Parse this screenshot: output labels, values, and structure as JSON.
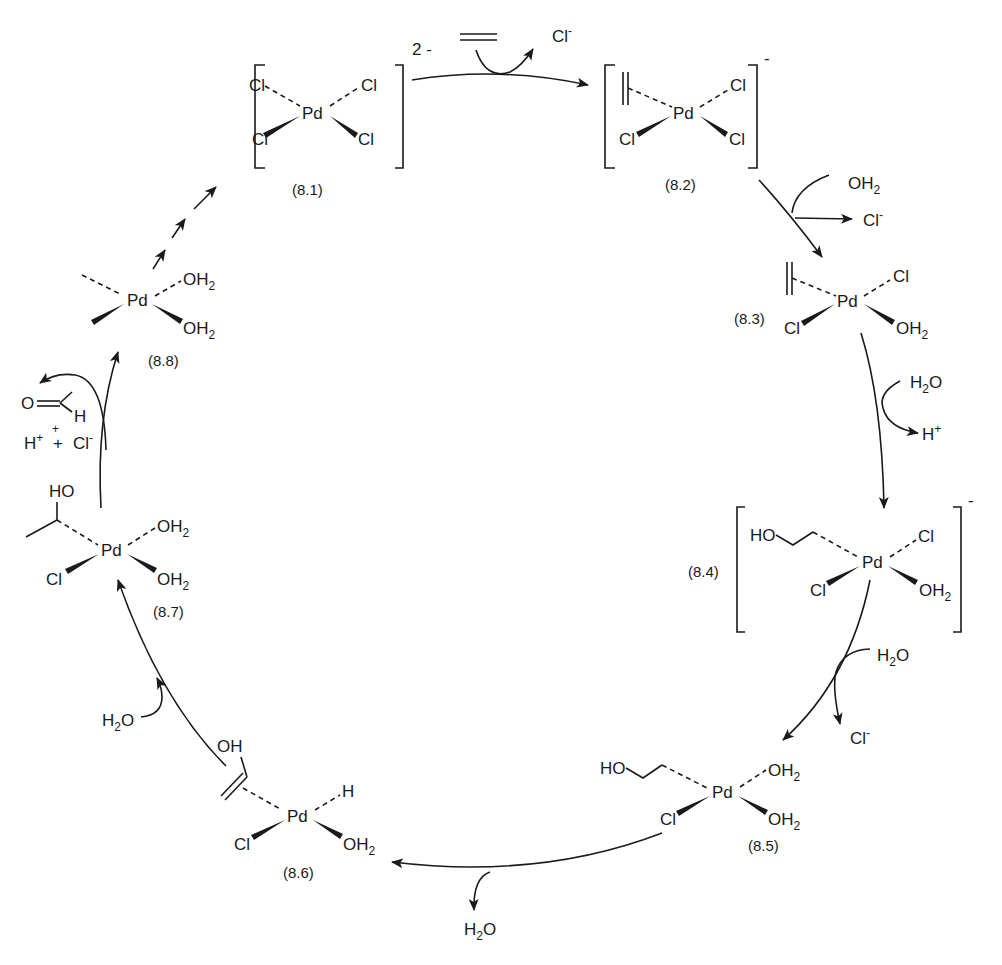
{
  "diagram": {
    "colors": {
      "ink": "#1a1a1a",
      "background": "#ffffff"
    },
    "species": [
      {
        "id": "8.1",
        "label": "(8.1)",
        "charge": "2 -",
        "ligands": {
          "top_left": "Cl",
          "top_right": "Cl",
          "bottom_left": "Cl",
          "bottom_right": "Cl"
        },
        "center": "Pd"
      },
      {
        "id": "8.2",
        "label": "(8.2)",
        "charge": "-",
        "ligands": {
          "top_left": "ethylene",
          "top_right": "Cl",
          "bottom_left": "Cl",
          "bottom_right": "Cl"
        },
        "center": "Pd"
      },
      {
        "id": "8.3",
        "label": "(8.3)",
        "ligands": {
          "top_left": "ethylene",
          "top_right": "Cl",
          "bottom_left": "Cl",
          "bottom_right": "OH2"
        },
        "center": "Pd"
      },
      {
        "id": "8.4",
        "label": "(8.4)",
        "charge": "-",
        "ligands": {
          "top_left": "HO-CH2CH2",
          "top_right": "Cl",
          "bottom_left": "Cl",
          "bottom_right": "OH2"
        },
        "center": "Pd"
      },
      {
        "id": "8.5",
        "label": "(8.5)",
        "ligands": {
          "top_left": "HO-CH2CH2",
          "top_right": "OH2",
          "bottom_left": "Cl",
          "bottom_right": "OH2"
        },
        "center": "Pd"
      },
      {
        "id": "8.6",
        "label": "(8.6)",
        "ligands": {
          "top_left": "vinyl alcohol (OH)",
          "top_right": "H",
          "bottom_left": "Cl",
          "bottom_right": "OH2"
        },
        "center": "Pd"
      },
      {
        "id": "8.7",
        "label": "(8.7)",
        "ligands": {
          "top_left": "CH(OH)CH3",
          "top_right": "OH2",
          "bottom_left": "Cl",
          "bottom_right": "OH2"
        },
        "center": "Pd"
      },
      {
        "id": "8.8",
        "label": "(8.8)",
        "ligands": {
          "top_left": "(vacant)",
          "top_right": "OH2",
          "bottom_left": "(vacant)",
          "bottom_right": "OH2"
        },
        "center": "Pd"
      }
    ],
    "text": {
      "pd": "Pd",
      "cl": "Cl",
      "o": "O",
      "h": "H",
      "ho": "HO",
      "oh": "OH",
      "two": "2",
      "plus": "+",
      "minus": "-",
      "charge_81": "2 -",
      "charge_minus": "-"
    },
    "steps": [
      {
        "from": "8.1",
        "to": "8.2",
        "in": "ethylene (=)",
        "out": "Cl-"
      },
      {
        "from": "8.2",
        "to": "8.3",
        "in": "OH2",
        "out": "Cl-"
      },
      {
        "from": "8.3",
        "to": "8.4",
        "in": "H2O",
        "out": "H+"
      },
      {
        "from": "8.4",
        "to": "8.5",
        "in": "H2O",
        "out": "Cl-"
      },
      {
        "from": "8.5",
        "to": "8.6",
        "out": "H2O"
      },
      {
        "from": "8.6",
        "to": "8.7",
        "in": "H2O"
      },
      {
        "from": "8.7",
        "to": "8.8",
        "out": "CH3CHO + H+ + H+ + Cl-"
      },
      {
        "from": "8.8",
        "to": "8.1",
        "style": "dashed multi-step"
      }
    ]
  }
}
